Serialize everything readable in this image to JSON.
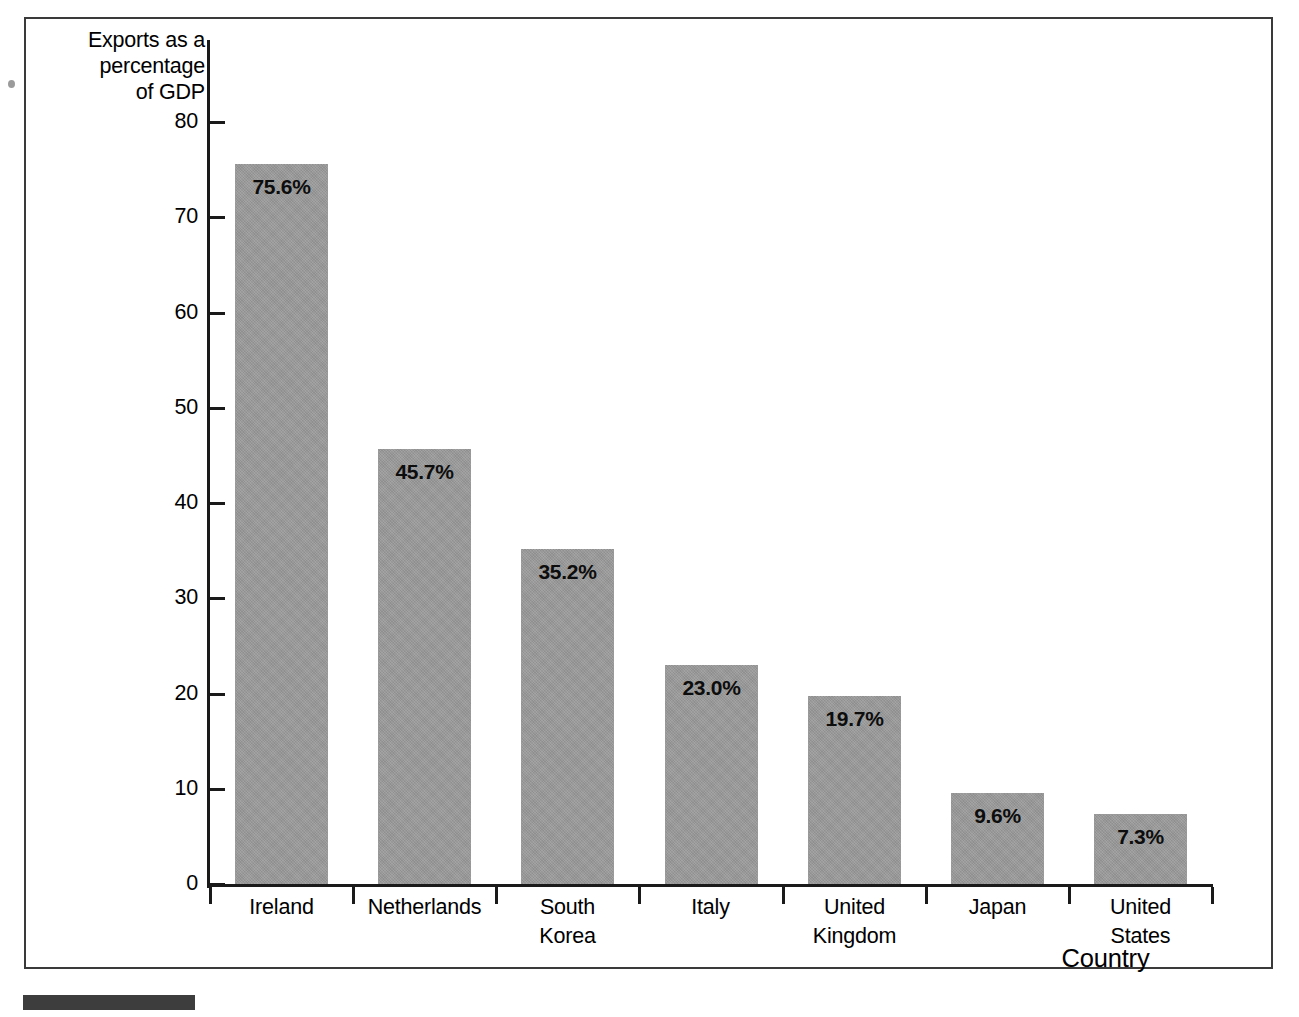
{
  "figure": {
    "frame_border_color": "#3a3a3a",
    "background_color": "#ffffff",
    "caption_block_color": "#3d3d3d",
    "edge_marker_color": "#9b9b9b"
  },
  "chart_data": {
    "type": "bar",
    "title": "",
    "subtitle": "",
    "xlabel": "Country",
    "ylabel": "Exports as a\npercentage\nof GDP",
    "categories": [
      "Ireland",
      "Netherlands",
      "South\nKorea",
      "Italy",
      "United\nKingdom",
      "Japan",
      "United\nStates"
    ],
    "values": [
      75.6,
      45.7,
      35.2,
      23.0,
      19.7,
      9.6,
      7.3
    ],
    "data_labels": [
      "75.6%",
      "45.7%",
      "35.2%",
      "23.0%",
      "19.7%",
      "9.6%",
      "7.3%"
    ],
    "ylim": [
      0,
      80
    ],
    "yticks": [
      80,
      70,
      60,
      50,
      40,
      30,
      20,
      10,
      0
    ],
    "ytick_labels": [
      "80",
      "70",
      "60",
      "50",
      "40",
      "30",
      "20",
      "10",
      "0"
    ],
    "grid": false,
    "legend": null,
    "legend_position": "none",
    "bar_color": "#9a9a9a",
    "axis_color": "#1a1a1a",
    "label_color": "#000000"
  }
}
